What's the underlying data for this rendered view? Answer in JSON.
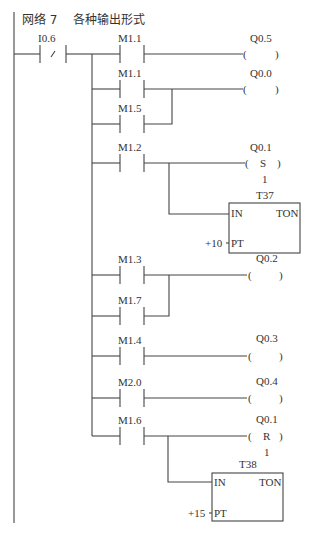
{
  "network": {
    "title": "网络 7    各种输出形式"
  },
  "rungs": [
    {
      "input": {
        "address": "I0.6",
        "type": "NC",
        "symbol": "/"
      }
    },
    {
      "contacts": [
        "M1.1"
      ],
      "output": {
        "address": "Q0.5",
        "type": "coil",
        "mid": ""
      }
    },
    {
      "contacts": [
        "M1.1",
        "M1.5"
      ],
      "output": {
        "address": "Q0.0",
        "type": "coil",
        "mid": ""
      }
    },
    {
      "contacts": [
        "M1.2"
      ],
      "output": {
        "address": "Q0.1",
        "type": "set",
        "mid": "S",
        "count": "1"
      },
      "timer": {
        "name": "T37",
        "in": "IN",
        "type": "TON",
        "pt_label": "PT",
        "pt_value": "+10"
      }
    },
    {
      "contacts": [
        "M1.3",
        "M1.7"
      ],
      "output": {
        "address": "Q0.2",
        "type": "coil",
        "mid": ""
      }
    },
    {
      "contacts": [
        "M1.4"
      ],
      "output": {
        "address": "Q0.3",
        "type": "coil",
        "mid": ""
      }
    },
    {
      "contacts": [
        "M2.0"
      ],
      "output": {
        "address": "Q0.4",
        "type": "coil",
        "mid": ""
      }
    },
    {
      "contacts": [
        "M1.6"
      ],
      "output": {
        "address": "Q0.1",
        "type": "reset",
        "mid": "R",
        "count": "1"
      },
      "timer": {
        "name": "T38",
        "in": "IN",
        "type": "TON",
        "pt_label": "PT",
        "pt_value": "+15"
      }
    }
  ],
  "labels": {
    "i06": "I0.6",
    "nc": "/",
    "m11a": "M1.1",
    "q05": "Q0.5",
    "m11b": "M1.1",
    "m15": "M1.5",
    "q00": "Q0.0",
    "m12": "M1.2",
    "q01s": "Q0.1",
    "s": "S",
    "one_a": "1",
    "t37": "T37",
    "in_a": "IN",
    "ton_a": "TON",
    "pt_a": "PT",
    "pv_a": "+10",
    "m13": "M1.3",
    "m17": "M1.7",
    "q02": "Q0.2",
    "m14": "M1.4",
    "q03": "Q0.3",
    "m20": "M2.0",
    "q04": "Q0.4",
    "m16": "M1.6",
    "q01r": "Q0.1",
    "r": "R",
    "one_b": "1",
    "t38": "T38",
    "in_b": "IN",
    "ton_b": "TON",
    "pt_b": "PT",
    "pv_b": "+15"
  }
}
